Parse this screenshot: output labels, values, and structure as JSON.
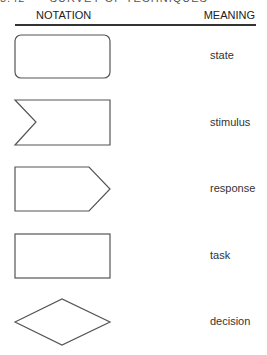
{
  "page_header": "8.42      SURVEY OF TECHNIQUES",
  "table": {
    "columns": {
      "notation": "NOTATION",
      "meaning": "MEANING"
    },
    "rows": [
      {
        "shape": "rounded-rectangle",
        "meaning": "state"
      },
      {
        "shape": "notched-rectangle",
        "meaning": "stimulus"
      },
      {
        "shape": "pointed-pentagon",
        "meaning": "response"
      },
      {
        "shape": "rectangle",
        "meaning": "task"
      },
      {
        "shape": "diamond",
        "meaning": "decision"
      }
    ]
  },
  "colors": {
    "stroke": "#555555",
    "rule": "#333333",
    "text": "#333333"
  }
}
